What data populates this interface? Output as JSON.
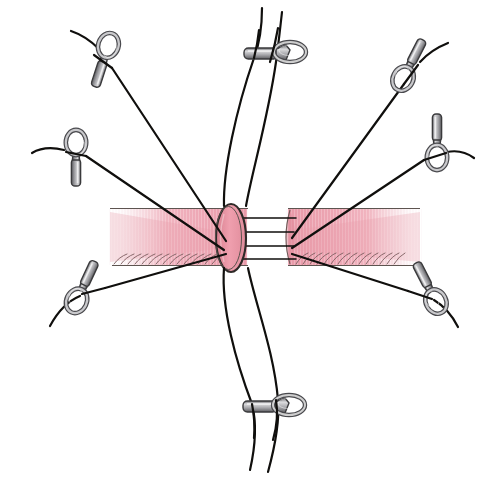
{
  "figure": {
    "title": "Microvascular end-to-end anastomosis with eight radial stay sutures",
    "subject": "anastomosis",
    "background_color": "#ffffff",
    "width": 490,
    "height": 478,
    "has_text_labels": false,
    "caption": ""
  },
  "colors": {
    "background": "#ffffff",
    "tissue_pink": "#f0a8b4",
    "tissue_pink_mid": "#eeb0bb",
    "tissue_pink_pale": "#f7d8de",
    "tissue_edge_line": "#5d5450",
    "lumen_pink": "#e694a4",
    "thread_black": "#100f0d",
    "clip_metal_light": "#d8d8da",
    "clip_metal_mid": "#9d9da1",
    "clip_metal_dark": "#5a5a5e",
    "hatch_mauve": "#7d5d60"
  },
  "tissue": {
    "name": "vessel-band",
    "description": "Horizontal tubular structure shown in pink, fading to white at both lateral ends",
    "band_top_y": 208,
    "band_bottom_y": 266,
    "left_extent_x": 110,
    "right_extent_x": 420,
    "gap_left_x": 246,
    "gap_right_x": 288
  },
  "lumen": {
    "name": "cut-end-lumen",
    "shape": "ellipse",
    "center_x": 231,
    "center_y": 238,
    "radius_x": 14,
    "radius_y": 33,
    "description": "Open cross-section of the proximal vessel stump"
  },
  "bridge_sutures": {
    "count": 4,
    "label": "Approximating suture strands spanning the anastomotic gap",
    "y_positions": [
      218,
      232,
      246,
      259
    ]
  },
  "stay_sutures": [
    {
      "id": "suture-top-center",
      "position": "top-center",
      "clip_orientation": "horizontal",
      "strand_count": 2,
      "clip_x": 270,
      "clip_y": 55
    },
    {
      "id": "suture-upper-left",
      "position": "upper-left",
      "clip_orientation": "diagonal",
      "strand_count": 1,
      "clip_x": 100,
      "clip_y": 58
    },
    {
      "id": "suture-upper-right",
      "position": "upper-right",
      "clip_orientation": "diagonal",
      "strand_count": 1,
      "clip_x": 415,
      "clip_y": 72
    },
    {
      "id": "suture-mid-left",
      "position": "mid-left",
      "clip_orientation": "vertical",
      "strand_count": 1,
      "clip_x": 74,
      "clip_y": 140
    },
    {
      "id": "suture-mid-right",
      "position": "mid-right",
      "clip_orientation": "vertical",
      "strand_count": 1,
      "clip_x": 436,
      "clip_y": 155
    },
    {
      "id": "suture-lower-left",
      "position": "lower-left",
      "clip_orientation": "diagonal",
      "strand_count": 1,
      "clip_x": 88,
      "clip_y": 298
    },
    {
      "id": "suture-lower-right",
      "position": "lower-right",
      "clip_orientation": "diagonal",
      "strand_count": 1,
      "clip_x": 422,
      "clip_y": 300
    },
    {
      "id": "suture-bottom-center",
      "position": "bottom-center",
      "clip_orientation": "horizontal",
      "strand_count": 2,
      "clip_x": 270,
      "clip_y": 408
    }
  ],
  "convergence_point": {
    "x": 231,
    "y": 240,
    "label": "anastomosis site"
  }
}
